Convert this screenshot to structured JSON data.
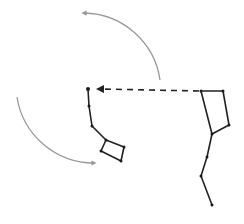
{
  "diagram": {
    "title": "",
    "colors": {
      "background": "#ffffff",
      "constellation_line": "#222222",
      "star": "#1a1a1a",
      "pointer_line": "#222222",
      "rotation_arrow": "#999999"
    },
    "little_dipper": {
      "stars": [
        {
          "name": "polaris",
          "x": 88,
          "y": 89
        },
        {
          "name": "handle-2",
          "x": 89,
          "y": 106
        },
        {
          "name": "handle-3",
          "x": 92,
          "y": 126
        },
        {
          "name": "handle-4",
          "x": 106,
          "y": 140
        },
        {
          "name": "bowl-1",
          "x": 124,
          "y": 147
        },
        {
          "name": "bowl-2",
          "x": 121,
          "y": 161
        },
        {
          "name": "bowl-3",
          "x": 101,
          "y": 151
        }
      ],
      "path": [
        [
          88,
          89
        ],
        [
          89,
          106
        ],
        [
          92,
          126
        ],
        [
          106,
          140
        ],
        [
          124,
          147
        ],
        [
          121,
          161
        ],
        [
          101,
          151
        ],
        [
          106,
          140
        ]
      ]
    },
    "big_dipper": {
      "stars": [
        {
          "name": "dubhe",
          "x": 201,
          "y": 91
        },
        {
          "name": "merak",
          "x": 223,
          "y": 91
        },
        {
          "name": "phecda",
          "x": 229,
          "y": 125
        },
        {
          "name": "megrez",
          "x": 212,
          "y": 134
        },
        {
          "name": "alioth",
          "x": 207,
          "y": 157
        },
        {
          "name": "mizar",
          "x": 201,
          "y": 176
        },
        {
          "name": "alkaid",
          "x": 212,
          "y": 205
        }
      ],
      "path": [
        [
          201,
          91
        ],
        [
          223,
          91
        ],
        [
          229,
          125
        ],
        [
          212,
          134
        ],
        [
          201,
          91
        ],
        [
          212,
          134
        ],
        [
          207,
          157
        ],
        [
          201,
          176
        ],
        [
          212,
          205
        ]
      ]
    },
    "pointer": {
      "from": [
        199,
        91
      ],
      "to": [
        98,
        89
      ],
      "style": "dashed"
    },
    "rotation_arrows": [
      {
        "name": "top-arc",
        "start": [
          160,
          80
        ],
        "end": [
          84,
          13
        ]
      },
      {
        "name": "left-arc",
        "start": [
          17,
          97
        ],
        "end": [
          94,
          163
        ]
      }
    ]
  }
}
